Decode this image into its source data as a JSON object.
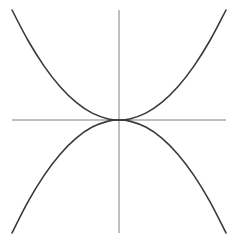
{
  "figure": {
    "background_color": "#ffffff",
    "width": 238,
    "height": 245
  },
  "chart_data": {
    "type": "line",
    "title": "",
    "xlabel": "",
    "ylabel": "",
    "grid": false,
    "legend": false,
    "axis_style": {
      "color": "#808080",
      "width": 1.0,
      "arrowheads": false,
      "ticks": false,
      "tick_labels": false
    },
    "curve_style": {
      "color": "#3a3a3a",
      "width": 1.6
    },
    "origin_px": {
      "x": 119,
      "y": 120
    },
    "axes_px": {
      "x_axis": {
        "x1": 12,
        "y1": 120,
        "x2": 226,
        "y2": 120
      },
      "y_axis": {
        "x1": 119,
        "y1": 10,
        "x2": 119,
        "y2": 233
      }
    },
    "axis_ranges": {
      "x": [
        -1.0,
        1.0
      ],
      "y": [
        -1.0,
        1.0
      ]
    },
    "series": [
      {
        "name": "upward-opening parabola",
        "equation": "y = a*x^2",
        "opens": "up",
        "vertex": [
          0,
          0
        ],
        "tangent_to": "x-axis at origin",
        "x": [
          -1.0,
          -0.85,
          -0.7,
          -0.55,
          -0.4,
          -0.25,
          -0.1,
          0,
          0.1,
          0.25,
          0.4,
          0.55,
          0.7,
          0.85,
          1.0
        ],
        "y": [
          1.0,
          0.7225,
          0.49,
          0.3025,
          0.16,
          0.0625,
          0.01,
          0,
          0.01,
          0.0625,
          0.16,
          0.3025,
          0.49,
          0.7225,
          1.0
        ]
      },
      {
        "name": "downward-opening parabola",
        "equation": "y = -a*x^2",
        "opens": "down",
        "vertex": [
          0,
          0
        ],
        "tangent_to": "x-axis at origin",
        "x": [
          -1.0,
          -0.85,
          -0.7,
          -0.55,
          -0.4,
          -0.25,
          -0.1,
          0,
          0.1,
          0.25,
          0.4,
          0.55,
          0.7,
          0.85,
          1.0
        ],
        "y": [
          -1.0,
          -0.7225,
          -0.49,
          -0.3025,
          -0.16,
          -0.0625,
          -0.01,
          0,
          -0.01,
          -0.0625,
          -0.16,
          -0.3025,
          -0.49,
          -0.7225,
          -1.0
        ]
      }
    ],
    "annotations": []
  }
}
